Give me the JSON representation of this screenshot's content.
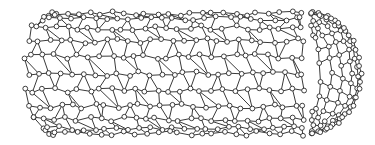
{
  "figure": {
    "colors": {
      "background": "#ffffff",
      "bond": "#3a3a3a",
      "atom_fill": "#ffffff",
      "atom_stroke": "#2a2a2a"
    },
    "tube": {
      "x0": 22,
      "x1": 302,
      "y0": 13,
      "y1": 134,
      "left_cap_radius": 34,
      "rows": 11,
      "cols": 26
    },
    "cap": {
      "cx": 306,
      "cy": 73,
      "rx": 54,
      "ry": 60,
      "rings": 6
    },
    "atom_radius": 2.4
  }
}
